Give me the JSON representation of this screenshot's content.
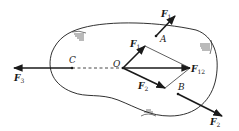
{
  "diagram": {
    "type": "force-diagram",
    "points": {
      "A": {
        "label": "A"
      },
      "B": {
        "label": "B"
      },
      "C": {
        "label": "C"
      },
      "O": {
        "label": "O"
      }
    },
    "forces": {
      "F1": {
        "main": "F",
        "sub": "1"
      },
      "F2": {
        "main": "F",
        "sub": "2"
      },
      "F3": {
        "main": "F",
        "sub": "3"
      },
      "F12": {
        "main": "F",
        "sub": "12"
      }
    },
    "parallelogram_labels": {
      "F1": {
        "main": "F",
        "sub": "1"
      },
      "F2": {
        "main": "F",
        "sub": "2"
      }
    },
    "colors": {
      "stroke": "#1a1a1a",
      "background": "#ffffff"
    }
  }
}
